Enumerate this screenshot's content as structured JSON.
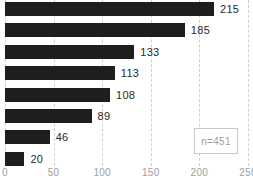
{
  "chart_data": {
    "type": "bar",
    "orientation": "horizontal",
    "values": [
      215,
      185,
      133,
      113,
      108,
      89,
      46,
      20
    ],
    "x_ticks": [
      0,
      50,
      100,
      150,
      200,
      250
    ],
    "xlim": [
      0,
      250
    ],
    "grid": "vertical dashed gridlines at each x tick",
    "legend_position": "none",
    "title": "",
    "xlabel": "",
    "ylabel": "",
    "annotation": "n=451",
    "bar_color": "#1e1e1e",
    "gridline_color": "#cfcfcf",
    "value_label_color": "#2a2a2a",
    "tick_label_color": "#9e9e9e"
  }
}
